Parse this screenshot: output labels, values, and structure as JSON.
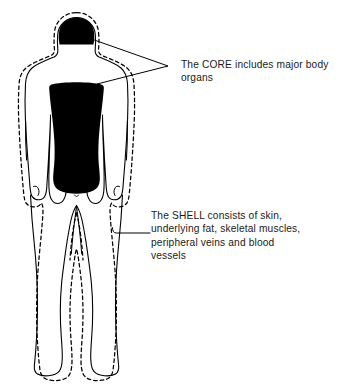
{
  "diagram": {
    "background_color": "#ffffff",
    "ink_color": "#000000",
    "fill_color": "#000000"
  },
  "annotations": {
    "core": {
      "label": "The CORE includes major body\norgans",
      "line1": "The CORE includes major body",
      "line2": "organs",
      "points_to": "head-core-region, torso-core-region"
    },
    "shell": {
      "label": "The SHELL consists of skin,\nunderlying fat, skeletal muscles,\nperipheral veins and blood\nvessels",
      "line1": "The SHELL consists of skin,",
      "line2": "underlying fat, skeletal muscles,",
      "line3": "peripheral veins and blood",
      "line4": "vessels",
      "points_to": "shell-dashed-outline"
    }
  },
  "regions": {
    "head_core": "black filled dome representing brain as core",
    "torso_core": "black filled trunk representing major body organs",
    "shell_outline": "dashed outline surrounding entire body representing the shell",
    "body_outline": "solid human body silhouette outline"
  }
}
